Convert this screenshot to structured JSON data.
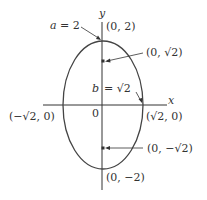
{
  "figure": {
    "type": "ellipse",
    "equation_params": {
      "a": 2,
      "b": "√2"
    },
    "axes": {
      "x_label": "x",
      "y_label": "y",
      "origin_label": "0"
    },
    "vertices": [
      {
        "label": "(0, 2)"
      },
      {
        "label": "(0, −2)"
      }
    ],
    "foci": [
      {
        "label": "(0, √2)"
      },
      {
        "label": "(0, −√2)"
      }
    ],
    "co_vertices": [
      {
        "label": "(−√2, 0)"
      },
      {
        "label": "(√2, 0)"
      }
    ],
    "annotations": {
      "a_name": "a",
      "a_value": "= 2",
      "b_name": "b",
      "b_value": "= √2"
    },
    "colors": {
      "stroke": "#333333",
      "background": "#ffffff"
    }
  }
}
